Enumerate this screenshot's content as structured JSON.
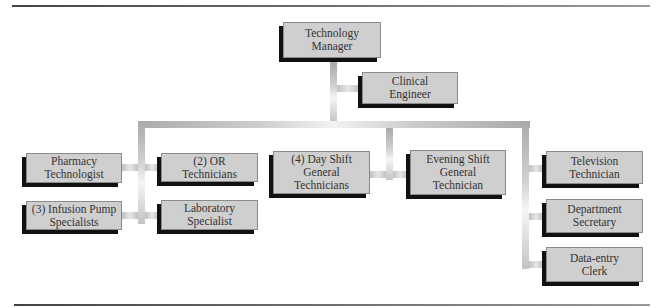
{
  "chart": {
    "type": "org-chart",
    "root": {
      "id": "manager",
      "lines": [
        "Technology",
        "Manager"
      ]
    },
    "staff": {
      "id": "clinical",
      "lines": [
        "Clinical",
        "Engineer"
      ]
    },
    "left_group": [
      {
        "id": "pharmacy",
        "lines": [
          "Pharmacy",
          "Technologist"
        ]
      },
      {
        "id": "infusion",
        "lines": [
          "(3) Infusion Pump",
          "Specialists"
        ]
      },
      {
        "id": "or",
        "lines": [
          "(2) OR",
          "Technicians"
        ]
      },
      {
        "id": "lab",
        "lines": [
          "Laboratory",
          "Specialist"
        ]
      }
    ],
    "center_group": [
      {
        "id": "day",
        "lines": [
          "(4) Day Shift",
          "General",
          "Technicians"
        ]
      },
      {
        "id": "evening",
        "lines": [
          "Evening Shift",
          "General",
          "Technician"
        ]
      }
    ],
    "right_group": [
      {
        "id": "tv",
        "lines": [
          "Television",
          "Technician"
        ]
      },
      {
        "id": "secretary",
        "lines": [
          "Department",
          "Secretary"
        ]
      },
      {
        "id": "dataentry",
        "lines": [
          "Data-entry",
          "Clerk"
        ]
      }
    ]
  },
  "colors": {
    "box_fill": "#cfcfcf",
    "box_shadow": "#111111",
    "text": "#333333",
    "connector": "#c0c0c0"
  }
}
